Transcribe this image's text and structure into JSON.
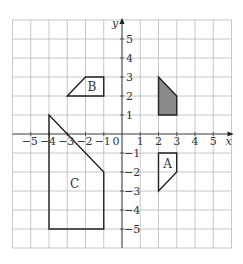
{
  "diagram": {
    "type": "coordinate-grid-transformations",
    "grid": {
      "x_min": -6,
      "x_max": 6,
      "y_min": -6,
      "y_max": 6,
      "step": 1
    },
    "axes": {
      "x_label": "x",
      "y_label": "y",
      "origin_label": "0",
      "x_ticks": [
        "−5",
        "−4",
        "−3",
        "−2",
        "−1",
        "1",
        "2",
        "3",
        "4",
        "5"
      ],
      "x_tick_values": [
        -5,
        -4,
        -3,
        -2,
        -1,
        1,
        2,
        3,
        4,
        5
      ],
      "y_ticks": [
        "5",
        "4",
        "3",
        "2",
        "1",
        "−1",
        "−2",
        "−3",
        "−4",
        "−5"
      ],
      "y_tick_values": [
        5,
        4,
        3,
        2,
        1,
        -1,
        -2,
        -3,
        -4,
        -5
      ]
    },
    "colors": {
      "grid": "#b8b8b8",
      "axis": "#555555",
      "outline": "#222222",
      "shaded_fill": "#8a8a8a",
      "text": "#333333"
    },
    "shapes": [
      {
        "name": "shaded",
        "label": "",
        "shaded": true,
        "vertices": [
          [
            2,
            3
          ],
          [
            3,
            2
          ],
          [
            3,
            1
          ],
          [
            2,
            1
          ]
        ]
      },
      {
        "name": "A",
        "label": "A",
        "shaded": false,
        "vertices": [
          [
            2,
            -1
          ],
          [
            3,
            -1
          ],
          [
            3,
            -2
          ],
          [
            2,
            -3
          ]
        ],
        "label_pos": [
          2.5,
          -1.6
        ]
      },
      {
        "name": "B",
        "label": "B",
        "shaded": false,
        "vertices": [
          [
            -3,
            2
          ],
          [
            -2,
            3
          ],
          [
            -1,
            3
          ],
          [
            -1,
            2
          ]
        ],
        "label_pos": [
          -1.65,
          2.5
        ]
      },
      {
        "name": "C",
        "label": "C",
        "shaded": false,
        "vertices": [
          [
            -4,
            1
          ],
          [
            -1,
            -2
          ],
          [
            -1,
            -5
          ],
          [
            -4,
            -5
          ]
        ],
        "label_pos": [
          -2.6,
          -2.65
        ]
      }
    ]
  }
}
